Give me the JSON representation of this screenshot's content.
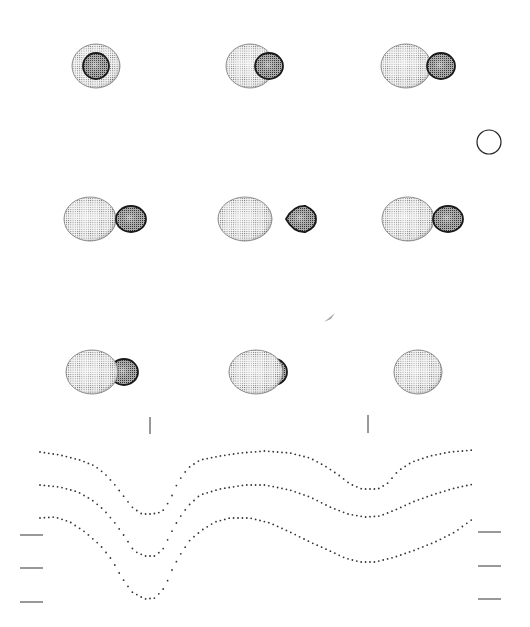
{
  "figure": {
    "title": "",
    "colors": {
      "background": "#ffffff",
      "primary_fill": "#e8e8e8",
      "primary_grid": "#555555",
      "secondary_fill": "#9a9a9a",
      "secondary_edge": "#1a1a1a",
      "curve_dots": "#333333",
      "tick": "#555555"
    },
    "scale_circle": {
      "cx": 489,
      "cy": 142,
      "r": 12
    },
    "comet_mark": {
      "x": 330,
      "y": 318
    },
    "panels": [
      {
        "row": 0,
        "col": 0,
        "cx": 96,
        "cy": 66,
        "primary": {
          "rx": 24,
          "ry": 22,
          "dx": 0
        },
        "secondary": {
          "rx": 13,
          "ry": 13,
          "dx": 0,
          "front": true
        }
      },
      {
        "row": 0,
        "col": 1,
        "cx": 250,
        "cy": 66,
        "primary": {
          "rx": 24,
          "ry": 22,
          "dx": 0
        },
        "secondary": {
          "rx": 14,
          "ry": 13,
          "dx": 19,
          "front": true
        }
      },
      {
        "row": 0,
        "col": 2,
        "cx": 406,
        "cy": 66,
        "primary": {
          "rx": 25,
          "ry": 22,
          "dx": 0
        },
        "secondary": {
          "rx": 14,
          "ry": 13,
          "dx": 35,
          "front": true
        }
      },
      {
        "row": 1,
        "col": 0,
        "cx": 90,
        "cy": 219,
        "primary": {
          "rx": 26,
          "ry": 22,
          "dx": 0
        },
        "secondary": {
          "rx": 15,
          "ry": 13,
          "dx": 41,
          "front": true
        }
      },
      {
        "row": 1,
        "col": 1,
        "cx": 245,
        "cy": 219,
        "primary": {
          "rx": 27,
          "ry": 22,
          "dx": 0
        },
        "secondary": {
          "rx": 15,
          "ry": 13,
          "dx": 56,
          "front": false,
          "teardrop": true
        }
      },
      {
        "row": 1,
        "col": 2,
        "cx": 408,
        "cy": 219,
        "primary": {
          "rx": 26,
          "ry": 22,
          "dx": 0
        },
        "secondary": {
          "rx": 15,
          "ry": 13,
          "dx": 40,
          "front": true
        }
      },
      {
        "row": 2,
        "col": 0,
        "cx": 92,
        "cy": 372,
        "primary": {
          "rx": 26,
          "ry": 22,
          "dx": 0
        },
        "secondary": {
          "rx": 14,
          "ry": 13,
          "dx": 32,
          "front": false
        }
      },
      {
        "row": 2,
        "col": 1,
        "cx": 256,
        "cy": 372,
        "primary": {
          "rx": 27,
          "ry": 22,
          "dx": 0
        },
        "secondary": {
          "rx": 13,
          "ry": 13,
          "dx": 18,
          "front": false
        }
      },
      {
        "row": 2,
        "col": 2,
        "cx": 418,
        "cy": 372,
        "primary": {
          "rx": 24,
          "ry": 22,
          "dx": 0
        },
        "secondary": null
      }
    ],
    "phase_markers": [
      {
        "x": 150,
        "y1": 417,
        "y2": 434
      },
      {
        "x": 368,
        "y1": 415,
        "y2": 433
      }
    ],
    "left_ticks": [
      {
        "y": 535,
        "x1": 20,
        "x2": 43
      },
      {
        "y": 568,
        "x1": 20,
        "x2": 43
      },
      {
        "y": 602,
        "x1": 20,
        "x2": 43
      }
    ],
    "right_ticks": [
      {
        "y": 532,
        "x1": 478,
        "x2": 501
      },
      {
        "y": 566,
        "x1": 478,
        "x2": 501
      },
      {
        "y": 599,
        "x1": 478,
        "x2": 501
      }
    ]
  },
  "chart_data": {
    "type": "scatter",
    "title": "",
    "xlabel": "",
    "ylabel": "",
    "x_range_px": [
      40,
      475
    ],
    "series": [
      {
        "name": "light curve 1",
        "points": [
          [
            40,
            452
          ],
          [
            60,
            455
          ],
          [
            80,
            460
          ],
          [
            95,
            466
          ],
          [
            105,
            474
          ],
          [
            115,
            485
          ],
          [
            125,
            498
          ],
          [
            133,
            508
          ],
          [
            142,
            514
          ],
          [
            152,
            514
          ],
          [
            162,
            512
          ],
          [
            170,
            500
          ],
          [
            178,
            482
          ],
          [
            188,
            468
          ],
          [
            200,
            460
          ],
          [
            220,
            456
          ],
          [
            240,
            453
          ],
          [
            265,
            451
          ],
          [
            290,
            453
          ],
          [
            310,
            458
          ],
          [
            325,
            466
          ],
          [
            340,
            476
          ],
          [
            350,
            484
          ],
          [
            362,
            489
          ],
          [
            378,
            489
          ],
          [
            388,
            483
          ],
          [
            398,
            471
          ],
          [
            412,
            462
          ],
          [
            430,
            456
          ],
          [
            450,
            452
          ],
          [
            474,
            450
          ]
        ]
      },
      {
        "name": "light curve 2",
        "points": [
          [
            40,
            485
          ],
          [
            60,
            487
          ],
          [
            78,
            492
          ],
          [
            92,
            500
          ],
          [
            104,
            510
          ],
          [
            115,
            523
          ],
          [
            125,
            537
          ],
          [
            134,
            551
          ],
          [
            145,
            556
          ],
          [
            155,
            556
          ],
          [
            163,
            549
          ],
          [
            170,
            535
          ],
          [
            178,
            520
          ],
          [
            188,
            506
          ],
          [
            200,
            495
          ],
          [
            220,
            489
          ],
          [
            245,
            485
          ],
          [
            265,
            485
          ],
          [
            290,
            490
          ],
          [
            310,
            497
          ],
          [
            330,
            507
          ],
          [
            348,
            514
          ],
          [
            365,
            517
          ],
          [
            380,
            516
          ],
          [
            395,
            510
          ],
          [
            415,
            501
          ],
          [
            435,
            494
          ],
          [
            455,
            488
          ],
          [
            474,
            484
          ]
        ]
      },
      {
        "name": "light curve 3",
        "points": [
          [
            40,
            518
          ],
          [
            55,
            517
          ],
          [
            70,
            522
          ],
          [
            85,
            532
          ],
          [
            100,
            545
          ],
          [
            112,
            560
          ],
          [
            122,
            578
          ],
          [
            132,
            592
          ],
          [
            145,
            599
          ],
          [
            155,
            598
          ],
          [
            165,
            587
          ],
          [
            172,
            570
          ],
          [
            180,
            555
          ],
          [
            190,
            540
          ],
          [
            202,
            530
          ],
          [
            215,
            522
          ],
          [
            230,
            518
          ],
          [
            250,
            518
          ],
          [
            270,
            523
          ],
          [
            290,
            532
          ],
          [
            310,
            542
          ],
          [
            330,
            551
          ],
          [
            345,
            558
          ],
          [
            360,
            562
          ],
          [
            375,
            562
          ],
          [
            395,
            557
          ],
          [
            415,
            550
          ],
          [
            435,
            542
          ],
          [
            455,
            532
          ],
          [
            474,
            518
          ]
        ]
      }
    ]
  }
}
